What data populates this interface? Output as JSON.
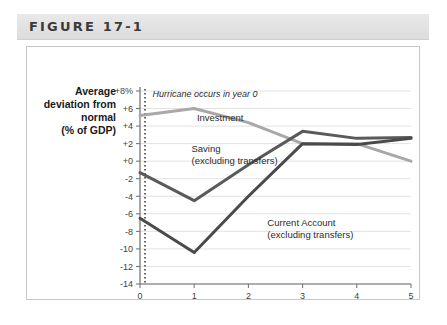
{
  "figure": {
    "title": "FIGURE 17-1"
  },
  "chart_data": {
    "type": "line",
    "title": "",
    "xlabel": "Years since hurricane",
    "ylabel": "Average deviation from normal (% of GDP)",
    "ylabel_lines": [
      "Average",
      "deviation from",
      "normal",
      "(% of GDP)"
    ],
    "x": [
      0,
      1,
      2,
      3,
      4,
      5
    ],
    "categories": [
      "0",
      "1",
      "2",
      "3",
      "4",
      "5"
    ],
    "xtick_labels": [
      "0",
      "1",
      "2",
      "3",
      "4",
      "5"
    ],
    "ytick_labels": [
      "+8%",
      "+6",
      "+4",
      "+2",
      "+0",
      "-2",
      "-4",
      "-6",
      "-8",
      "-10",
      "-12",
      "-14"
    ],
    "ytick_values": [
      8,
      6,
      4,
      2,
      0,
      -2,
      -4,
      -6,
      -8,
      -10,
      -12,
      -14
    ],
    "ylim": [
      -14,
      8
    ],
    "xlim": [
      0,
      5
    ],
    "grid": true,
    "legend": "inline-labels",
    "series": [
      {
        "name": "Investment",
        "color": "#a8a8a8",
        "values": [
          5.2,
          6.0,
          4.4,
          2.0,
          2.0,
          0.0
        ],
        "label": "Investment",
        "label_x": 1.05,
        "label_y": 4.6
      },
      {
        "name": "Saving (excluding transfers)",
        "color": "#5a5a5a",
        "values": [
          -1.3,
          -4.5,
          -0.4,
          3.4,
          2.6,
          2.7
        ],
        "label_lines": [
          "Saving",
          "(excluding transfers)"
        ],
        "label_x": 0.95,
        "label_y": 1.0
      },
      {
        "name": "Current Account (excluding transfers)",
        "color": "#4a4a4a",
        "values": [
          -6.5,
          -10.4,
          -4.0,
          2.0,
          1.9,
          2.6
        ],
        "label_lines": [
          "Current Account",
          "(excluding transfers)"
        ],
        "label_x": 2.35,
        "label_y": -7.4
      }
    ],
    "annotations": [
      {
        "text": "Hurricane occurs in year 0",
        "x": 0.12,
        "y": 7.3,
        "style": "italic"
      }
    ],
    "event_marker": {
      "name": "hurricane-event-line",
      "x": 0,
      "style": "dotted"
    }
  }
}
